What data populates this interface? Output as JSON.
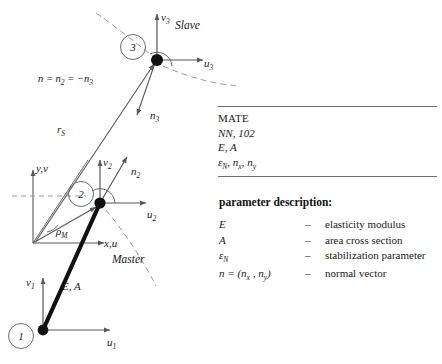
{
  "diagram": {
    "nodes": [
      {
        "id": "1",
        "label": "1",
        "x": 43,
        "y": 330,
        "circle_x": 21,
        "circle_y": 336
      },
      {
        "id": "2",
        "label": "2",
        "x": 100,
        "y": 203,
        "circle_x": 81,
        "circle_y": 194
      },
      {
        "id": "3",
        "label": "3",
        "x": 157,
        "y": 60,
        "circle_x": 133,
        "circle_y": 47
      }
    ],
    "node1_labels": {
      "v": "v1",
      "u": "u1",
      "bar": "E, A"
    },
    "node2_labels": {
      "v": "v2",
      "u": "u2",
      "n": "n2"
    },
    "node3_labels": {
      "v": "v3",
      "u": "u3",
      "n": "n3"
    },
    "global_axes": {
      "y_label": "y,v",
      "x_label": "x,u"
    },
    "rho_label": "rM",
    "rs_label": "rS",
    "normal_equation": "n = n2 = −n3",
    "region_master": "Master",
    "region_slave": "Slave",
    "colors": {
      "line": "#58585a",
      "bar": "#111111",
      "node": "#111111",
      "dashed": "#9a9a9a",
      "rule": "#6e6e6e"
    }
  },
  "mate_table": {
    "rows": [
      {
        "text": "MATE",
        "style": "code"
      },
      {
        "text": "NN, 102",
        "style": "ital"
      },
      {
        "text": "E, A",
        "style": "ital"
      },
      {
        "text": "εN, nx, ny",
        "style": "ital"
      }
    ]
  },
  "parameters": {
    "title": "parameter description:",
    "dash": "–",
    "items": [
      {
        "symbol": "E",
        "description": "elasticity modulus"
      },
      {
        "symbol": "A",
        "description": "area cross section"
      },
      {
        "symbol": "εN",
        "description": "stabilization parameter"
      },
      {
        "symbol": "n = (nx , ny)",
        "description": "normal vector"
      }
    ]
  }
}
